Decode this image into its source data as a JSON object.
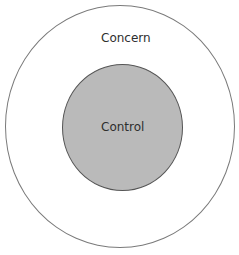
{
  "diagram": {
    "type": "concentric-circles",
    "outer_circle": {
      "label": "Concern",
      "fill": "#ffffff",
      "stroke": "#7a7a7a"
    },
    "inner_circle": {
      "label": "Control",
      "fill": "#bababa",
      "stroke": "#555555"
    }
  }
}
